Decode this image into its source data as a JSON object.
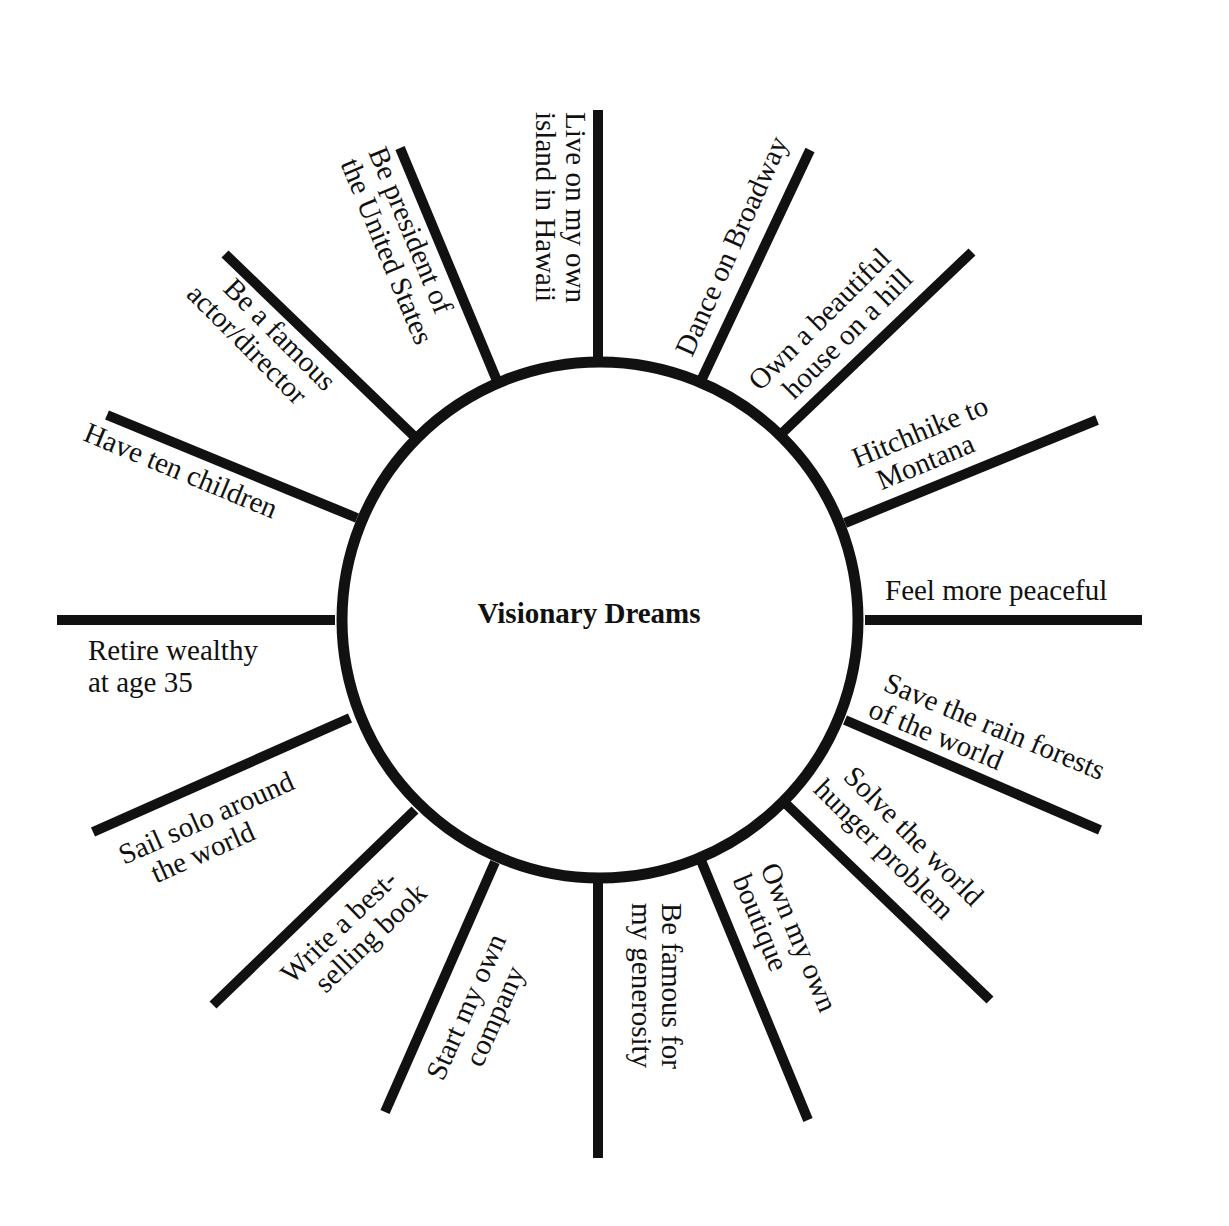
{
  "diagram": {
    "title": "Visionary Dreams",
    "colors": {
      "line": "#111111",
      "background": "#ffffff",
      "text": "#111111"
    },
    "spokes": [
      {
        "id": "hawaii",
        "line1": "Live on my own",
        "line2": "island in Hawaii"
      },
      {
        "id": "broadway",
        "line1": "Dance on Broadway",
        "line2": ""
      },
      {
        "id": "house",
        "line1": "Own a beautiful",
        "line2": "house on a hill"
      },
      {
        "id": "montana",
        "line1": "Hitchhike to",
        "line2": "Montana"
      },
      {
        "id": "peaceful",
        "line1": "Feel more peaceful",
        "line2": ""
      },
      {
        "id": "rainforest",
        "line1": "Save the rain forests",
        "line2": "of the world"
      },
      {
        "id": "hunger",
        "line1": "Solve the world",
        "line2": "hunger problem"
      },
      {
        "id": "boutique",
        "line1": "Own my own",
        "line2": "boutique"
      },
      {
        "id": "generosity",
        "line1": "Be famous for",
        "line2": "my generosity"
      },
      {
        "id": "company",
        "line1": "Start my own",
        "line2": "company"
      },
      {
        "id": "bestseller",
        "line1": "Write a best-",
        "line2": "selling book"
      },
      {
        "id": "sail",
        "line1": "Sail solo around",
        "line2": "the world"
      },
      {
        "id": "retire",
        "line1": "Retire wealthy",
        "line2": "at age 35"
      },
      {
        "id": "children",
        "line1": "Have ten children",
        "line2": ""
      },
      {
        "id": "actor",
        "line1": "Be a famous",
        "line2": "actor/director"
      },
      {
        "id": "president",
        "line1": "Be president of",
        "line2": "the United States"
      }
    ]
  }
}
